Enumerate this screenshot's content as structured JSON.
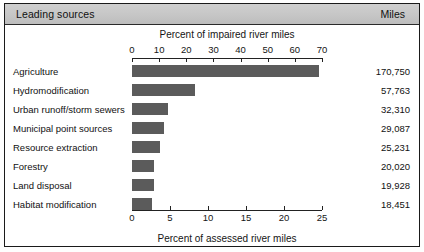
{
  "header": {
    "left_title": "Leading sources",
    "right_title": "Miles"
  },
  "chart_data": {
    "type": "bar",
    "orientation": "horizontal",
    "title": "Leading sources",
    "top_axis_title": "Percent of impaired river miles",
    "bottom_axis_title": "Percent of assessed river miles",
    "value_column_header": "Miles",
    "grid": false,
    "legend": "none",
    "top_axis": {
      "label": "Percent of impaired river miles",
      "ticks": [
        0,
        10,
        20,
        30,
        40,
        50,
        60,
        70
      ],
      "tick_labels": [
        "0",
        "10",
        "20",
        "30",
        "40",
        "50",
        "60",
        "70"
      ],
      "range": [
        0,
        70
      ]
    },
    "bottom_axis": {
      "label": "Percent of assessed river miles",
      "ticks": [
        0,
        5,
        10,
        15,
        20,
        25
      ],
      "tick_labels": [
        "0",
        "5",
        "10",
        "15",
        "20",
        "25"
      ],
      "range": [
        0,
        25
      ]
    },
    "categories": [
      "Agriculture",
      "Hydromodification",
      "Urban runoff/storm sewers",
      "Municipal point sources",
      "Resource extraction",
      "Forestry",
      "Land disposal",
      "Habitat modification"
    ],
    "miles": [
      170750,
      57763,
      32310,
      29087,
      25231,
      20020,
      19928,
      18451
    ],
    "miles_labels": [
      "170,750",
      "57,763",
      "32,310",
      "29,087",
      "25,231",
      "20,020",
      "19,928",
      "18,451"
    ],
    "percent_impaired": [
      69.0,
      23.3,
      13.1,
      11.8,
      10.2,
      8.1,
      8.1,
      7.5
    ],
    "percent_assessed": [
      24.6,
      8.3,
      4.7,
      4.2,
      3.6,
      2.9,
      2.9,
      2.7
    ],
    "series": [
      {
        "name": "Percent of impaired river miles",
        "values": [
          69.0,
          23.3,
          13.1,
          11.8,
          10.2,
          8.1,
          8.1,
          7.5
        ]
      }
    ],
    "bar_color": "#5b5b5b",
    "header_color": "#c8c8c8"
  }
}
